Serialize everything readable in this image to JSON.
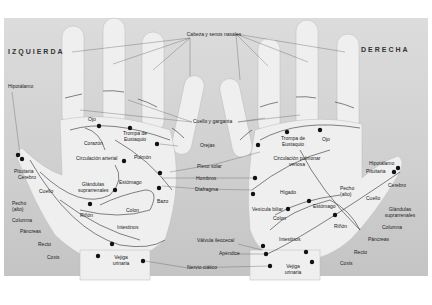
{
  "diagram": {
    "type": "reflexology-hand-map",
    "sides": {
      "left": "IZQUIERDA",
      "right": "DERECHA"
    },
    "center_labels": {
      "cabeza_senos": "Cabeza y senos nasales",
      "cuello_garganta": "Cuello y garganta",
      "orejas": "Orejas",
      "plexo_solar": "Plexo solar",
      "hombros": "Hombros",
      "diafragma": "Diafragma",
      "valvula": "Válvula ileocecal",
      "apendice": "Apéndice",
      "nervio": "Nervio ciático"
    },
    "left_hand": {
      "hipotalamo": "Hipotálamo",
      "ojo": "Ojo",
      "trompa": "Trompa de Eustaquio",
      "corazon": "Corazón",
      "circulacion": "Circulación arterial",
      "pulmon": "Pulmón",
      "pituitaria": "Pituitaria",
      "cerebro": "Cerebro",
      "cuello": "Cuello",
      "glandulas": "Glándulas suprarrenales",
      "estomago": "Estómago",
      "pecho": "Pecho (alto)",
      "columna": "Columna",
      "rinon": "Riñón",
      "colon": "Colon",
      "bazo": "Bazo",
      "pancreas": "Páncreas",
      "intestinos": "Intestinos",
      "recto": "Recto",
      "coxis": "Coxis",
      "vejiga": "Vejiga urinaria"
    },
    "right_hand": {
      "trompa": "Trompa de Eustaquio",
      "ojo": "Ojo",
      "circulacion": "Circulación pulmonar venosa",
      "higado": "Hígado",
      "pecho": "Pecho (alto)",
      "hipotalamo": "Hipotálamo",
      "pituitaria": "Pituitaria",
      "cerebro": "Cerebro",
      "cuello": "Cuello",
      "vesicula": "Vesícula biliar",
      "estomago": "Estómago",
      "glandulas": "Glándulas suprarrenales",
      "colon": "Colon",
      "rinon": "Riñón",
      "columna": "Columna",
      "intestinos": "Intestinos",
      "pancreas": "Páncreas",
      "recto": "Recto",
      "coxis": "Coxis",
      "vejiga": "Vejiga urinaria"
    }
  }
}
